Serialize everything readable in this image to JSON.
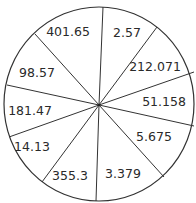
{
  "diagram": {
    "type": "divided-circle",
    "sector_count": 10,
    "sectors": [
      {
        "label": "2.57"
      },
      {
        "label": "212.071"
      },
      {
        "label": "51.158"
      },
      {
        "label": "5.675"
      },
      {
        "label": "3.379"
      },
      {
        "label": "355.3"
      },
      {
        "label": "14.13"
      },
      {
        "label": "181.47"
      },
      {
        "label": "98.57"
      },
      {
        "label": "401.65"
      }
    ],
    "colors": {
      "line": "#333333",
      "text": "#2a2a2a",
      "background": "#ffffff"
    }
  }
}
